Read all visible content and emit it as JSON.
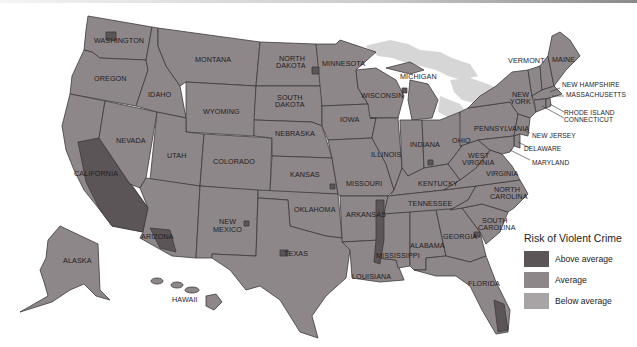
{
  "map": {
    "title": "Risk of Violent Crime",
    "region": "United States",
    "colors": {
      "above_average": "#5b5557",
      "average": "#8e8789",
      "below_average": "#a8a3a4",
      "lakes": "#d6d6d6",
      "borders": "#3e3a3b"
    },
    "state_labels": {
      "washington": "WASHINGTON",
      "oregon": "OREGON",
      "california": "CALIFORNIA",
      "nevada": "NEVADA",
      "idaho": "IDAHO",
      "montana": "MONTANA",
      "wyoming": "WYOMING",
      "utah": "UTAH",
      "arizona": "ARIZONA",
      "colorado": "COLORADO",
      "new_mexico_1": "NEW",
      "new_mexico_2": "MEXICO",
      "north_dakota_1": "NORTH",
      "north_dakota_2": "DAKOTA",
      "south_dakota_1": "SOUTH",
      "south_dakota_2": "DAKOTA",
      "nebraska": "NEBRASKA",
      "kansas": "KANSAS",
      "oklahoma": "OKLAHOMA",
      "texas": "TEXAS",
      "minnesota": "MINNESOTA",
      "iowa": "IOWA",
      "missouri": "MISSOURI",
      "arkansas": "ARKANSAS",
      "louisiana": "LOUISIANA",
      "wisconsin": "WISCONSIN",
      "illinois": "ILLINOIS",
      "michigan": "MICHIGAN",
      "indiana": "INDIANA",
      "ohio": "OHIO",
      "kentucky": "KENTUCKY",
      "tennessee": "TENNESSEE",
      "mississippi": "MISSISSIPPI",
      "alabama": "ALABAMA",
      "georgia": "GEORGIA",
      "florida": "FLORIDA",
      "south_carolina_1": "SOUTH",
      "south_carolina_2": "CAROLINA",
      "north_carolina_1": "NORTH",
      "north_carolina_2": "CAROLINA",
      "virginia": "VIRGINIA",
      "west_virginia_1": "WEST",
      "west_virginia_2": "VIRGINIA",
      "pennsylvania": "PENNSYLVANIA",
      "new_york_1": "NEW",
      "new_york_2": "YORK",
      "vermont": "VERMONT",
      "maine": "MAINE",
      "new_hampshire": "NEW HAMPSHIRE",
      "massachusetts": "MASSACHUSETTS",
      "rhode_island": "RHODE ISLAND",
      "connecticut": "CONNECTICUT",
      "new_jersey": "NEW JERSEY",
      "delaware": "DELAWARE",
      "maryland": "MARYLAND",
      "alaska": "ALASKA",
      "hawaii": "HAWAII"
    }
  },
  "legend": {
    "title": "Risk of Violent Crime",
    "items": [
      {
        "label": "Above average",
        "color": "#5b5557"
      },
      {
        "label": "Average",
        "color": "#8e8789"
      },
      {
        "label": "Below average",
        "color": "#a8a3a4"
      }
    ]
  }
}
